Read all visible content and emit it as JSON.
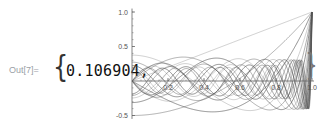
{
  "cell": {
    "out_label": "Out[7]=",
    "brace_open": "{",
    "value": "0.106904,",
    "brace_close": "}"
  },
  "chart_data": {
    "type": "line",
    "title": "",
    "xlabel": "",
    "ylabel": "",
    "series_n": [
      1,
      2,
      3,
      4,
      5,
      6,
      7,
      8,
      9,
      10,
      11,
      12,
      13,
      14,
      15,
      16,
      17,
      18,
      19,
      20
    ],
    "xlim": [
      0,
      1.0
    ],
    "ylim": [
      -0.55,
      1.05
    ],
    "x_ticks": [
      0.2,
      0.4,
      0.6,
      0.8,
      1.0
    ],
    "x_tick_labels": [
      "0.2",
      "0.4",
      "0.6",
      "0.8",
      "1.0"
    ],
    "y_ticks": [
      -0.5,
      0.5,
      1.0
    ],
    "y_tick_labels": [
      "-0.5",
      "0.5",
      "1.0"
    ],
    "grid": false,
    "legend": "none",
    "line_color": "#555555"
  }
}
